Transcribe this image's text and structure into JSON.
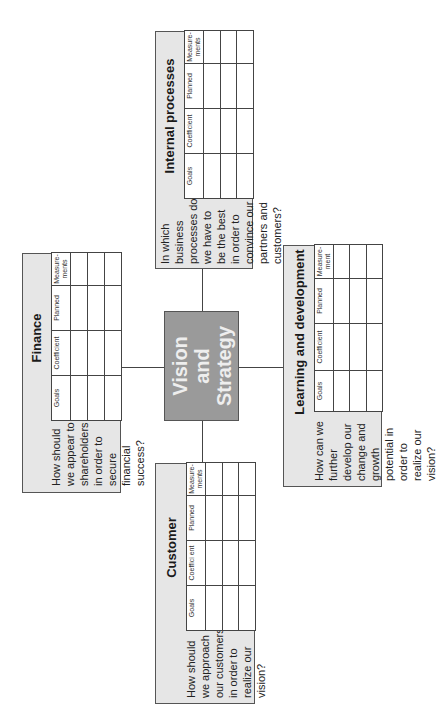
{
  "center": {
    "lines": [
      "Vision",
      "and",
      "Strategy"
    ],
    "fill_color": "#9a9a9a",
    "text_color": "#eeeeee"
  },
  "panels": {
    "finance": {
      "title": "Finance",
      "question": "How should we appear to shareholders in order to secure financial success?",
      "columns": [
        "Goals",
        "Coefficient",
        "Planned",
        "Measure-ments"
      ],
      "rows": 3
    },
    "internal": {
      "title": "Internal processes",
      "question": "In which business processes do we have to be the best in order to convince our partners and customers?",
      "columns": [
        "Goals",
        "Coefficient",
        "Planned",
        "Measure-ments"
      ],
      "rows": 3
    },
    "customer": {
      "title": "Customer",
      "question": "How should we approach our customers in order to realize our vision?",
      "columns": [
        "Goals",
        "Coeffici ent",
        "Planned",
        "Measure-ments"
      ],
      "rows": 3
    },
    "learning": {
      "title": "Learning and development",
      "question": "How can we further develop our change and growth potential in order to realize our vision?",
      "columns": [
        "Goals",
        "Coefficient",
        "Planned",
        "Measure-ment"
      ],
      "rows": 3
    }
  },
  "colors": {
    "panel_fill": "#e6e6e6",
    "border": "#555555",
    "table_fill": "#ffffff"
  }
}
